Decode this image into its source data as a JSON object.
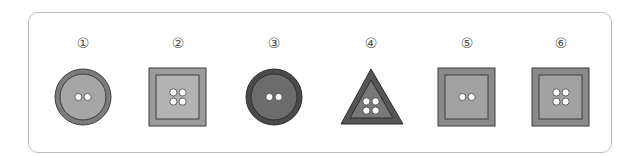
{
  "figure": {
    "items": [
      {
        "label": "①",
        "shape": "circle",
        "holes": 2,
        "outer": "#7c7c7c",
        "inner": "#a6a6a6",
        "stroke": "#3c3c3c"
      },
      {
        "label": "②",
        "shape": "square",
        "holes": 4,
        "outer": "#9c9c9c",
        "inner": "#b3b3b3",
        "stroke": "#3c3c3c"
      },
      {
        "label": "③",
        "shape": "circle",
        "holes": 2,
        "outer": "#4a4a4a",
        "inner": "#6c6c6c",
        "stroke": "#2c2c2c"
      },
      {
        "label": "④",
        "shape": "triangle",
        "holes": 4,
        "outer": "#555555",
        "inner": "#787878",
        "stroke": "#2c2c2c"
      },
      {
        "label": "⑤",
        "shape": "square",
        "holes": 2,
        "outer": "#8a8a8a",
        "inner": "#a2a2a2",
        "stroke": "#3c3c3c"
      },
      {
        "label": "⑥",
        "shape": "square",
        "holes": 4,
        "outer": "#8a8a8a",
        "inner": "#a2a2a2",
        "stroke": "#3c3c3c"
      }
    ]
  }
}
